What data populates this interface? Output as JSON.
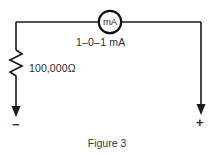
{
  "figure": {
    "caption": "Figure 3",
    "background_color": "#ffffff",
    "line_color": "#1a1a1a",
    "text_color": "#2b2b2b"
  },
  "circuit": {
    "meter": {
      "symbol_label": "mA",
      "range_label": "1–0–1 mA",
      "shape": "circle",
      "center_x": 110,
      "center_y": 22,
      "radius": 12
    },
    "resistor": {
      "value_label": "100,000Ω",
      "symbol": "zigzag",
      "orientation": "vertical",
      "x": 16,
      "top_y": 50,
      "bottom_y": 78
    },
    "terminals": [
      {
        "name": "negative-terminal",
        "label": "−",
        "x": 16,
        "y": 122,
        "arrow_direction": "down"
      },
      {
        "name": "positive-terminal",
        "label": "+",
        "x": 201,
        "y": 122,
        "arrow_direction": "down"
      }
    ],
    "wires": [
      {
        "name": "top-left-wire",
        "from": [
          16,
          22
        ],
        "to": [
          98,
          22
        ]
      },
      {
        "name": "top-right-wire",
        "from": [
          122,
          22
        ],
        "to": [
          201,
          22
        ]
      },
      {
        "name": "left-upper-wire",
        "from": [
          16,
          22
        ],
        "to": [
          16,
          50
        ]
      },
      {
        "name": "left-lower-wire",
        "from": [
          16,
          78
        ],
        "to": [
          16,
          116
        ]
      },
      {
        "name": "right-wire",
        "from": [
          201,
          22
        ],
        "to": [
          201,
          116
        ]
      }
    ]
  }
}
